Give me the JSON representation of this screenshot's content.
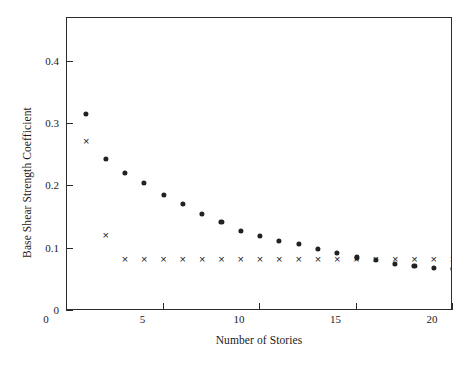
{
  "chart_data": {
    "type": "scatter",
    "title": "",
    "xlabel": "Number of Stories",
    "ylabel": "Base Shear Strength Coefficient",
    "xlim": [
      0,
      20
    ],
    "ylim": [
      0,
      0.47
    ],
    "grid": false,
    "legend": "none",
    "xticks": [
      "0",
      "5",
      "10",
      "15",
      "20"
    ],
    "xtick_values": [
      0,
      5,
      10,
      15,
      20
    ],
    "yticks": [
      "0",
      "0.1",
      "0.2",
      "0.3",
      "0.4"
    ],
    "ytick_values": [
      0,
      0.1,
      0.2,
      0.3,
      0.4
    ],
    "x": [
      1,
      2,
      3,
      4,
      5,
      6,
      7,
      8,
      9,
      10,
      11,
      12,
      13,
      14,
      15,
      16,
      17,
      18,
      19,
      20
    ],
    "series": [
      {
        "name": "dot-series",
        "marker": "filled-circle",
        "color": "#222222",
        "values": [
          0.316,
          0.244,
          0.222,
          0.206,
          0.186,
          0.172,
          0.156,
          0.143,
          0.128,
          0.121,
          0.113,
          0.107,
          0.099,
          0.093,
          0.086,
          0.082,
          0.075,
          0.072,
          0.069,
          0.067
        ]
      },
      {
        "name": "cross-series",
        "marker": "cross",
        "color": "#222222",
        "values": [
          0.272,
          0.122,
          0.084,
          0.084,
          0.084,
          0.084,
          0.084,
          0.084,
          0.084,
          0.084,
          0.084,
          0.084,
          0.084,
          0.084,
          0.084,
          0.084,
          0.084,
          0.084,
          0.084,
          0.084
        ]
      }
    ]
  }
}
